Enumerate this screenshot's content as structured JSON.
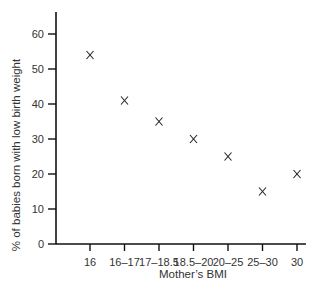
{
  "chart_data": {
    "type": "scatter",
    "title": "",
    "xlabel": "Mother’s BMI",
    "ylabel": "% of babies born with low birth weight",
    "categories": [
      "16",
      "16–17",
      "17–18.5",
      "18.5–20",
      "20–25",
      "25–30",
      "30"
    ],
    "values": [
      54,
      41,
      35,
      30,
      25,
      15,
      20
    ],
    "marker": "x",
    "yticks": [
      0,
      10,
      20,
      30,
      40,
      50,
      60
    ],
    "ylim": [
      0,
      65
    ],
    "grid": false,
    "legend": null
  }
}
